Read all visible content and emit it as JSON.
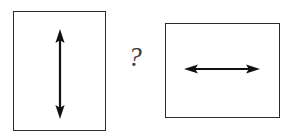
{
  "figure": {
    "background_color": "#ffffff",
    "width": 294,
    "height": 137,
    "stroke_color": "#2b2b2b",
    "arrow_color": "#111111",
    "question_color": "#3a3a3a"
  },
  "left_panel": {
    "name": "portrait-rectangle",
    "orientation": "portrait",
    "x": 13,
    "y": 11,
    "width": 93,
    "height": 120,
    "fill": "#ffffff",
    "border_color": "#2b2b2b",
    "border_width": 1.4,
    "arrow": {
      "name": "vertical-double-arrow",
      "direction": "vertical",
      "heads": "double",
      "center_x": 60,
      "start_y": 30,
      "end_y": 118,
      "length": 88,
      "color": "#111111"
    }
  },
  "right_panel": {
    "name": "landscape-rectangle",
    "orientation": "landscape",
    "x": 165,
    "y": 23,
    "width": 115,
    "height": 95,
    "fill": "#ffffff",
    "border_color": "#2b2b2b",
    "border_width": 1.4,
    "arrow": {
      "name": "horizontal-double-arrow",
      "direction": "horizontal",
      "heads": "double",
      "center_y": 69,
      "start_x": 185,
      "end_x": 259,
      "length": 74,
      "color": "#111111"
    }
  },
  "connector": {
    "name": "question-mark",
    "label": "?",
    "x": 128,
    "y": 48,
    "style": "italic-serif",
    "color": "#3a3a3a"
  }
}
